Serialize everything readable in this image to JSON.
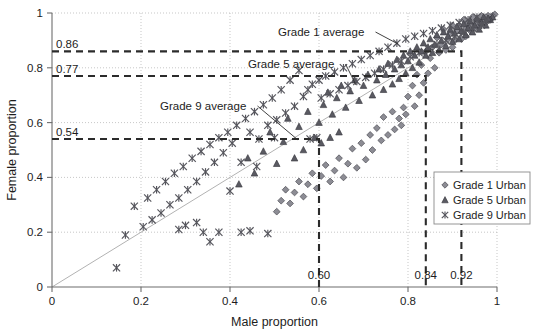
{
  "figure": {
    "background": "#ffffff",
    "plot_frame": "open-left-bottom"
  },
  "axes": {
    "xlabel": "Male proportion",
    "ylabel": "Female proportion",
    "xticks": [
      "0",
      "0.2",
      "0.4",
      "0.6",
      "0.8",
      "1"
    ],
    "xtick_values": [
      0,
      0.2,
      0.4,
      0.6,
      0.8,
      1
    ],
    "yticks": [
      "0",
      "0.2",
      "0.4",
      "0.6",
      "0.8",
      "1"
    ],
    "ytick_values": [
      0,
      0.2,
      0.4,
      0.6,
      0.8,
      1
    ],
    "xlim": [
      0,
      1
    ],
    "ylim": [
      0,
      1
    ],
    "grid": true
  },
  "legend": {
    "position": "bottom-right",
    "entries": [
      {
        "label": "Grade 1 Urban",
        "marker": "diamond",
        "color": "#8c8c94"
      },
      {
        "label": "Grade 5 Urban",
        "marker": "triangle",
        "color": "#5a5a62"
      },
      {
        "label": "Grade 9 Urban",
        "marker": "asterisk-x",
        "color": "#55555c"
      }
    ]
  },
  "annotations": {
    "grade1": {
      "label": "Grade 1 average",
      "x_value_label": "0.92",
      "y_value_label": "0.86",
      "x": 0.92,
      "y": 0.86
    },
    "grade5": {
      "label": "Grade 5 average",
      "x_value_label": "0.84",
      "y_value_label": "0.77",
      "x": 0.84,
      "y": 0.77
    },
    "grade9": {
      "label": "Grade 9 average",
      "x_value_label": "0.60",
      "y_value_label": "0.54",
      "x": 0.6,
      "y": 0.54
    }
  },
  "chart_data": {
    "type": "scatter",
    "title": "",
    "xlabel": "Male proportion",
    "ylabel": "Female proportion",
    "xlim": [
      0,
      1
    ],
    "ylim": [
      0,
      1
    ],
    "grid": true,
    "legend_position": "bottom-right",
    "reference_line": {
      "type": "line",
      "description": "identity-like diagonal reference",
      "from": [
        0,
        0
      ],
      "to": [
        1,
        1
      ]
    },
    "average_markers": [
      {
        "name": "Grade 1 average",
        "x": 0.92,
        "y": 0.86
      },
      {
        "name": "Grade 5 average",
        "x": 0.84,
        "y": 0.77
      },
      {
        "name": "Grade 9 average",
        "x": 0.6,
        "y": 0.54
      }
    ],
    "series": [
      {
        "name": "Grade 1 Urban",
        "marker": "diamond",
        "color": "#8c8c94",
        "points": [
          [
            0.995,
            0.995
          ],
          [
            0.99,
            0.99
          ],
          [
            0.985,
            0.985
          ],
          [
            0.98,
            0.99
          ],
          [
            0.985,
            0.975
          ],
          [
            0.975,
            0.985
          ],
          [
            0.97,
            0.975
          ],
          [
            0.975,
            0.965
          ],
          [
            0.965,
            0.99
          ],
          [
            0.96,
            0.97
          ],
          [
            0.96,
            0.955
          ],
          [
            0.955,
            0.975
          ],
          [
            0.95,
            0.96
          ],
          [
            0.95,
            0.945
          ],
          [
            0.945,
            0.985
          ],
          [
            0.94,
            0.955
          ],
          [
            0.94,
            0.935
          ],
          [
            0.935,
            0.965
          ],
          [
            0.93,
            0.945
          ],
          [
            0.93,
            0.915
          ],
          [
            0.925,
            0.975
          ],
          [
            0.92,
            0.93
          ],
          [
            0.92,
            0.905
          ],
          [
            0.915,
            0.955
          ],
          [
            0.91,
            0.935
          ],
          [
            0.905,
            0.9
          ],
          [
            0.9,
            0.955
          ],
          [
            0.9,
            0.875
          ],
          [
            0.895,
            0.925
          ],
          [
            0.89,
            0.905
          ],
          [
            0.885,
            0.865
          ],
          [
            0.88,
            0.94
          ],
          [
            0.875,
            0.885
          ],
          [
            0.87,
            0.855
          ],
          [
            0.865,
            0.91
          ],
          [
            0.86,
            0.8
          ],
          [
            0.855,
            0.875
          ],
          [
            0.85,
            0.835
          ],
          [
            0.845,
            0.78
          ],
          [
            0.84,
            0.86
          ],
          [
            0.835,
            0.745
          ],
          [
            0.83,
            0.81
          ],
          [
            0.825,
            0.7
          ],
          [
            0.82,
            0.775
          ],
          [
            0.815,
            0.66
          ],
          [
            0.81,
            0.735
          ],
          [
            0.8,
            0.695
          ],
          [
            0.795,
            0.63
          ],
          [
            0.79,
            0.655
          ],
          [
            0.785,
            0.59
          ],
          [
            0.78,
            0.615
          ],
          [
            0.77,
            0.575
          ],
          [
            0.765,
            0.64
          ],
          [
            0.755,
            0.555
          ],
          [
            0.745,
            0.62
          ],
          [
            0.74,
            0.535
          ],
          [
            0.73,
            0.58
          ],
          [
            0.72,
            0.5
          ],
          [
            0.715,
            0.555
          ],
          [
            0.705,
            0.465
          ],
          [
            0.695,
            0.525
          ],
          [
            0.685,
            0.435
          ],
          [
            0.675,
            0.505
          ],
          [
            0.665,
            0.45
          ],
          [
            0.655,
            0.4
          ],
          [
            0.645,
            0.47
          ],
          [
            0.635,
            0.425
          ],
          [
            0.625,
            0.385
          ],
          [
            0.615,
            0.445
          ],
          [
            0.605,
            0.405
          ],
          [
            0.595,
            0.36
          ],
          [
            0.585,
            0.415
          ],
          [
            0.575,
            0.375
          ],
          [
            0.565,
            0.33
          ],
          [
            0.555,
            0.385
          ],
          [
            0.545,
            0.345
          ],
          [
            0.535,
            0.305
          ],
          [
            0.525,
            0.355
          ],
          [
            0.515,
            0.315
          ],
          [
            0.505,
            0.275
          ]
        ]
      },
      {
        "name": "Grade 5 Urban",
        "marker": "triangle",
        "color": "#5a5a62",
        "points": [
          [
            0.99,
            0.985
          ],
          [
            0.985,
            0.975
          ],
          [
            0.98,
            0.98
          ],
          [
            0.975,
            0.955
          ],
          [
            0.97,
            0.985
          ],
          [
            0.965,
            0.965
          ],
          [
            0.96,
            0.94
          ],
          [
            0.955,
            0.98
          ],
          [
            0.95,
            0.955
          ],
          [
            0.945,
            0.93
          ],
          [
            0.94,
            0.97
          ],
          [
            0.935,
            0.945
          ],
          [
            0.93,
            0.92
          ],
          [
            0.925,
            0.96
          ],
          [
            0.92,
            0.935
          ],
          [
            0.915,
            0.905
          ],
          [
            0.91,
            0.95
          ],
          [
            0.905,
            0.925
          ],
          [
            0.9,
            0.895
          ],
          [
            0.895,
            0.94
          ],
          [
            0.89,
            0.915
          ],
          [
            0.885,
            0.88
          ],
          [
            0.88,
            0.93
          ],
          [
            0.875,
            0.9
          ],
          [
            0.87,
            0.865
          ],
          [
            0.865,
            0.92
          ],
          [
            0.86,
            0.885
          ],
          [
            0.855,
            0.855
          ],
          [
            0.85,
            0.905
          ],
          [
            0.845,
            0.875
          ],
          [
            0.84,
            0.845
          ],
          [
            0.835,
            0.89
          ],
          [
            0.83,
            0.86
          ],
          [
            0.825,
            0.82
          ],
          [
            0.82,
            0.875
          ],
          [
            0.815,
            0.845
          ],
          [
            0.81,
            0.8
          ],
          [
            0.805,
            0.86
          ],
          [
            0.8,
            0.825
          ],
          [
            0.795,
            0.78
          ],
          [
            0.79,
            0.845
          ],
          [
            0.785,
            0.81
          ],
          [
            0.78,
            0.76
          ],
          [
            0.775,
            0.83
          ],
          [
            0.77,
            0.795
          ],
          [
            0.765,
            0.74
          ],
          [
            0.755,
            0.815
          ],
          [
            0.75,
            0.775
          ],
          [
            0.745,
            0.72
          ],
          [
            0.735,
            0.795
          ],
          [
            0.73,
            0.755
          ],
          [
            0.72,
            0.7
          ],
          [
            0.71,
            0.775
          ],
          [
            0.7,
            0.735
          ],
          [
            0.69,
            0.68
          ],
          [
            0.68,
            0.755
          ],
          [
            0.67,
            0.715
          ],
          [
            0.66,
            0.655
          ],
          [
            0.65,
            0.735
          ],
          [
            0.645,
            0.565
          ],
          [
            0.64,
            0.69
          ],
          [
            0.63,
            0.63
          ],
          [
            0.625,
            0.545
          ],
          [
            0.62,
            0.71
          ],
          [
            0.61,
            0.665
          ],
          [
            0.605,
            0.525
          ],
          [
            0.6,
            0.6
          ],
          [
            0.59,
            0.545
          ],
          [
            0.575,
            0.64
          ],
          [
            0.565,
            0.5
          ],
          [
            0.555,
            0.585
          ],
          [
            0.545,
            0.47
          ],
          [
            0.53,
            0.615
          ],
          [
            0.52,
            0.53
          ],
          [
            0.505,
            0.45
          ],
          [
            0.49,
            0.565
          ],
          [
            0.475,
            0.495
          ],
          [
            0.455,
            0.415
          ],
          [
            0.44,
            0.47
          ],
          [
            0.42,
            0.375
          ]
        ]
      },
      {
        "name": "Grade 9 Urban",
        "marker": "asterisk-x",
        "color": "#55555c",
        "points": [
          [
            0.975,
            0.975
          ],
          [
            0.965,
            0.955
          ],
          [
            0.955,
            0.985
          ],
          [
            0.945,
            0.945
          ],
          [
            0.935,
            0.975
          ],
          [
            0.925,
            0.93
          ],
          [
            0.915,
            0.965
          ],
          [
            0.905,
            0.915
          ],
          [
            0.895,
            0.955
          ],
          [
            0.885,
            0.9
          ],
          [
            0.875,
            0.945
          ],
          [
            0.865,
            0.885
          ],
          [
            0.855,
            0.935
          ],
          [
            0.845,
            0.87
          ],
          [
            0.835,
            0.925
          ],
          [
            0.825,
            0.855
          ],
          [
            0.815,
            0.915
          ],
          [
            0.805,
            0.84
          ],
          [
            0.795,
            0.905
          ],
          [
            0.785,
            0.825
          ],
          [
            0.775,
            0.89
          ],
          [
            0.765,
            0.81
          ],
          [
            0.755,
            0.875
          ],
          [
            0.745,
            0.795
          ],
          [
            0.735,
            0.86
          ],
          [
            0.725,
            0.78
          ],
          [
            0.715,
            0.845
          ],
          [
            0.705,
            0.765
          ],
          [
            0.695,
            0.83
          ],
          [
            0.685,
            0.75
          ],
          [
            0.675,
            0.815
          ],
          [
            0.665,
            0.735
          ],
          [
            0.655,
            0.8
          ],
          [
            0.645,
            0.72
          ],
          [
            0.635,
            0.785
          ],
          [
            0.625,
            0.705
          ],
          [
            0.615,
            0.77
          ],
          [
            0.605,
            0.69
          ],
          [
            0.6,
            0.755
          ],
          [
            0.595,
            0.545
          ],
          [
            0.585,
            0.74
          ],
          [
            0.58,
            0.54
          ],
          [
            0.575,
            0.72
          ],
          [
            0.565,
            0.695
          ],
          [
            0.555,
            0.79
          ],
          [
            0.545,
            0.66
          ],
          [
            0.535,
            0.755
          ],
          [
            0.525,
            0.635
          ],
          [
            0.515,
            0.72
          ],
          [
            0.505,
            0.61
          ],
          [
            0.5,
            0.545
          ],
          [
            0.495,
            0.69
          ],
          [
            0.485,
            0.59
          ],
          [
            0.475,
            0.665
          ],
          [
            0.465,
            0.54
          ],
          [
            0.46,
            0.44
          ],
          [
            0.455,
            0.64
          ],
          [
            0.445,
            0.565
          ],
          [
            0.435,
            0.615
          ],
          [
            0.425,
            0.455
          ],
          [
            0.415,
            0.59
          ],
          [
            0.405,
            0.525
          ],
          [
            0.4,
            0.35
          ],
          [
            0.395,
            0.565
          ],
          [
            0.385,
            0.49
          ],
          [
            0.375,
            0.545
          ],
          [
            0.365,
            0.455
          ],
          [
            0.355,
            0.52
          ],
          [
            0.345,
            0.42
          ],
          [
            0.34,
            0.2
          ],
          [
            0.335,
            0.495
          ],
          [
            0.325,
            0.385
          ],
          [
            0.315,
            0.47
          ],
          [
            0.305,
            0.355
          ],
          [
            0.295,
            0.44
          ],
          [
            0.285,
            0.325
          ],
          [
            0.275,
            0.415
          ],
          [
            0.265,
            0.3
          ],
          [
            0.255,
            0.385
          ],
          [
            0.245,
            0.27
          ],
          [
            0.235,
            0.355
          ],
          [
            0.225,
            0.245
          ],
          [
            0.215,
            0.325
          ],
          [
            0.205,
            0.22
          ],
          [
            0.185,
            0.295
          ],
          [
            0.165,
            0.19
          ],
          [
            0.145,
            0.07
          ],
          [
            0.375,
            0.2
          ],
          [
            0.425,
            0.2
          ],
          [
            0.445,
            0.205
          ],
          [
            0.485,
            0.195
          ],
          [
            0.355,
            0.165
          ],
          [
            0.325,
            0.235
          ],
          [
            0.3,
            0.225
          ],
          [
            0.285,
            0.21
          ]
        ]
      }
    ]
  }
}
